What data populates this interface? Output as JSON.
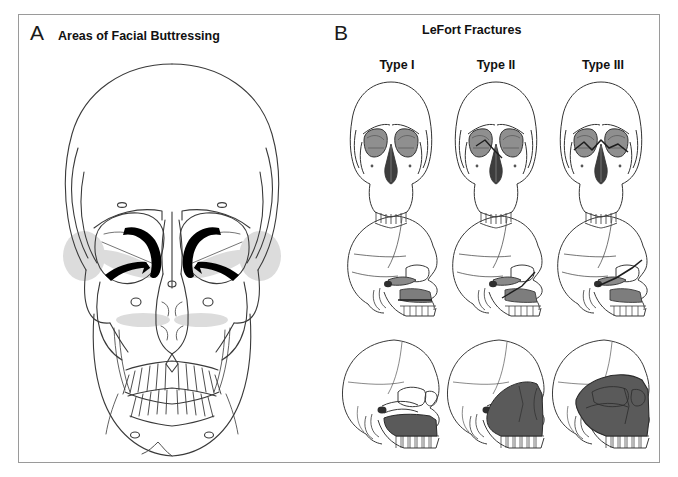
{
  "figure": {
    "background_color": "#ffffff",
    "border_color": "#9a9a9a",
    "panels": [
      {
        "letter": "A",
        "title": "Areas of Facial Buttressing",
        "view": "anterior skull with highlighted buttress regions"
      },
      {
        "letter": "B",
        "title": "LeFort Fractures",
        "view": "three-by-three grid of skull illustrations"
      }
    ]
  },
  "panel_a": {
    "letter": "A",
    "title": "Areas of Facial Buttressing",
    "buttress_highlight_color": "#000000",
    "soft_shade_color": "#d9d9d9"
  },
  "panel_b": {
    "letter": "B",
    "title": "LeFort Fractures",
    "columns": [
      {
        "label": "Type I"
      },
      {
        "label": "Type II"
      },
      {
        "label": "Type III"
      }
    ],
    "rows": [
      {
        "name": "frontal-view"
      },
      {
        "name": "lateral-view"
      },
      {
        "name": "oblique-view-shaded"
      }
    ],
    "orbit_shade_color": "#8a8a8a",
    "nasal_shade_color": "#3d3d3d",
    "fracture_shade_color": "#595959"
  }
}
